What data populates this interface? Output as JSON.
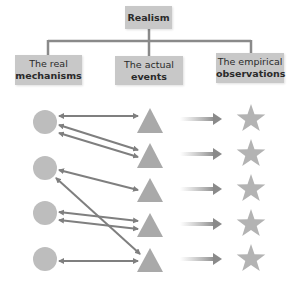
{
  "diagram": {
    "root": {
      "label": "Realism"
    },
    "categories": [
      {
        "line1": "The real",
        "line2": "mechanisms"
      },
      {
        "line1": "The actual",
        "line2": "events"
      },
      {
        "line1": "The empirical",
        "line2": "observations"
      }
    ],
    "nodes": {
      "mechanisms": {
        "shape": "circle",
        "count": 4,
        "color": "#bdbdbd"
      },
      "events": {
        "shape": "triangle",
        "count": 5,
        "color": "#a9a9a9"
      },
      "observations": {
        "shape": "star",
        "count": 5,
        "color": "#b3b3b3"
      }
    },
    "connections": [
      {
        "from": "circle-1",
        "to": "triangle-1"
      },
      {
        "from": "circle-1",
        "to": "triangle-2"
      },
      {
        "from": "circle-1",
        "to": "triangle-2"
      },
      {
        "from": "circle-2",
        "to": "triangle-3"
      },
      {
        "from": "circle-2",
        "to": "triangle-5"
      },
      {
        "from": "circle-3",
        "to": "triangle-4"
      },
      {
        "from": "circle-3",
        "to": "triangle-4"
      },
      {
        "from": "circle-4",
        "to": "triangle-5"
      }
    ],
    "colors": {
      "box": "#c8c8c8",
      "line": "#8a8a8a",
      "arrow": "#808080",
      "text": "#2a2a2a"
    }
  }
}
